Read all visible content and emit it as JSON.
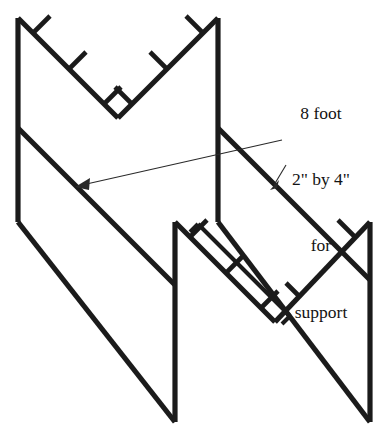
{
  "figure": {
    "width": 390,
    "height": 436,
    "background_color": "#ffffff",
    "line_color": "#1b1b1b",
    "leader_color": "#2a2a2a"
  },
  "annotation": {
    "name": "support-callout",
    "lines": [
      "8 foot",
      "2\" by 4\"",
      "for",
      "support"
    ],
    "full_text": "8 foot 2\" by 4\" for support",
    "align": "center"
  },
  "leaders": [
    {
      "name": "long-leader-to-front-rail",
      "from": [
        282,
        140
      ],
      "to": [
        76,
        186
      ],
      "arrow_at": "to"
    },
    {
      "name": "short-leader-to-rear-rail",
      "from": [
        286,
        166
      ],
      "to": [
        271,
        188
      ],
      "arrow_at": "to"
    }
  ],
  "geometry": {
    "front_frame": {
      "name": "front-v-frame",
      "left_post": [
        [
          18,
          18
        ],
        [
          18,
          222
        ]
      ],
      "right_post": [
        [
          218,
          18
        ],
        [
          218,
          222
        ]
      ],
      "v_left_arm": [
        [
          18,
          18
        ],
        [
          118,
          118
        ]
      ],
      "v_right_arm": [
        [
          118,
          118
        ],
        [
          218,
          18
        ]
      ],
      "v_vertex": [
        118,
        118
      ]
    },
    "rear_frame": {
      "name": "rear-v-frame",
      "left_post": [
        [
          175,
          222
        ],
        [
          175,
          422
        ]
      ],
      "right_post": [
        [
          370,
          222
        ],
        [
          370,
          422
        ]
      ],
      "v_left_arm": [
        [
          175,
          222
        ],
        [
          275,
          322
        ]
      ],
      "v_right_arm": [
        [
          275,
          322
        ],
        [
          370,
          222
        ]
      ],
      "v_vertex": [
        275,
        322
      ]
    },
    "rails": [
      {
        "name": "upper-long-rail",
        "from": [
          18,
          128
        ],
        "to": [
          175,
          285
        ]
      },
      {
        "name": "lower-long-rail",
        "from": [
          18,
          222
        ],
        "to": [
          175,
          422
        ]
      },
      {
        "name": "upper-right-rail",
        "from": [
          218,
          128
        ],
        "to": [
          370,
          280
        ]
      },
      {
        "name": "lower-right-rail",
        "from": [
          218,
          222
        ],
        "to": [
          370,
          422
        ]
      }
    ],
    "cleat_count_front_left": 3,
    "cleat_count_front_right": 3,
    "cleat_count_rear_left": 3,
    "cleat_count_rear_right": 1,
    "support_board": {
      "name": "eight-foot-two-by-four",
      "from": [
        190,
        232
      ],
      "to": [
        282,
        324
      ],
      "offset": 11
    }
  }
}
